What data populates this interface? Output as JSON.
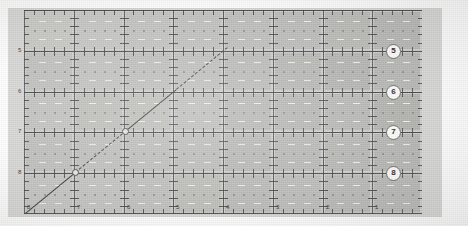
{
  "figure": {
    "type": "grid-diagram",
    "background_color": "#cfcfcd",
    "grid_line_color": "#3c3c3a",
    "badge_fill": "#fbfbf9",
    "diagonal_color": "#3a3a38"
  },
  "chart_data": {
    "type": "heatmap",
    "title": "",
    "xlabel": "",
    "ylabel": "",
    "grid": true,
    "legend_position": "none",
    "columns": 8,
    "rows": 5,
    "x_tick_labels": [
      "8",
      "7",
      "6",
      "5",
      "4",
      "3",
      "2",
      "1"
    ],
    "y_tick_labels": [
      "5",
      "6",
      "7",
      "8"
    ],
    "minor_ticks_per_cell": 5,
    "diagonal_series": {
      "name": "diagonal-trace",
      "style": "dashed",
      "points": [
        [
          0,
          0
        ],
        [
          1,
          1
        ],
        [
          2,
          2
        ],
        [
          3,
          3
        ],
        [
          4,
          4
        ]
      ]
    }
  },
  "right_badges": [
    {
      "label": "5",
      "row": 1
    },
    {
      "label": "6",
      "row": 2
    },
    {
      "label": "7",
      "row": 3
    },
    {
      "label": "8",
      "row": 4
    }
  ],
  "left_labels": [
    {
      "label": "5"
    },
    {
      "label": "6"
    },
    {
      "label": "7"
    },
    {
      "label": "8"
    }
  ],
  "bottom_labels": [
    {
      "label": "8"
    },
    {
      "label": "7"
    },
    {
      "label": "6"
    },
    {
      "label": "5"
    },
    {
      "label": "4"
    },
    {
      "label": "3"
    },
    {
      "label": "2"
    },
    {
      "label": "1"
    }
  ]
}
